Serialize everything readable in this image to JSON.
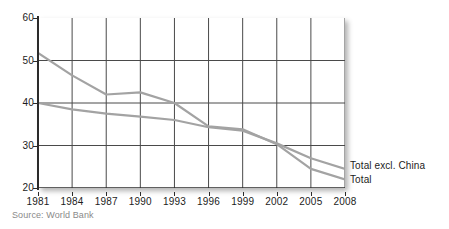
{
  "figure": {
    "source_note": "Source: World Bank",
    "background_color": "#ffffff"
  },
  "axes": {
    "y_tick_labels": [
      "60",
      "50",
      "40",
      "30",
      "20"
    ],
    "x_tick_labels": [
      "1981",
      "1984",
      "1987",
      "1990",
      "1993",
      "1996",
      "1999",
      "2002",
      "2005",
      "2008"
    ]
  },
  "series_labels": {
    "total_excl_china": "Total excl. China",
    "total": "Total"
  },
  "chart_data": {
    "type": "line",
    "title": "",
    "subtitle": "",
    "xlabel": "",
    "ylabel": "",
    "source": "Source: World Bank",
    "x": [
      1981,
      1984,
      1987,
      1990,
      1993,
      1996,
      1999,
      2002,
      2005,
      2008
    ],
    "xlim": [
      1981,
      2008
    ],
    "ylim": [
      20,
      60
    ],
    "y_ticks": [
      20,
      30,
      40,
      50,
      60
    ],
    "x_ticks": [
      1981,
      1984,
      1987,
      1990,
      1993,
      1996,
      1999,
      2002,
      2005,
      2008
    ],
    "grid": {
      "horizontal": [
        30,
        40,
        50
      ],
      "vertical": [
        1981,
        1984,
        1987,
        1990,
        1993,
        1996,
        1999,
        2002,
        2005,
        2008
      ],
      "grid_color": "#4a4a4a"
    },
    "legend_position": "inline-right",
    "line_color": "#a3a3a3",
    "line_width": 2.2,
    "series": [
      {
        "name": "Total",
        "label_position": "inline-right-lower",
        "values": [
          51.8,
          46.5,
          42.0,
          42.5,
          40.0,
          34.5,
          33.8,
          30.3,
          24.5,
          22.0
        ]
      },
      {
        "name": "Total excl. China",
        "label_position": "inline-right-upper",
        "values": [
          40.0,
          38.5,
          37.5,
          36.8,
          36.0,
          34.3,
          33.5,
          30.5,
          27.0,
          24.5
        ]
      }
    ]
  }
}
